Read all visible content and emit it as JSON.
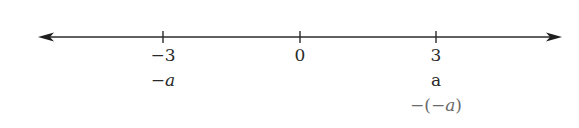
{
  "diagram": {
    "type": "number-line",
    "line": {
      "y": 37,
      "x_start": 38,
      "x_end": 562,
      "color": "#2b2b2b"
    },
    "ticks": [
      {
        "value": -3,
        "x": 163,
        "label": "−3"
      },
      {
        "value": 0,
        "x": 300,
        "label": "0"
      },
      {
        "value": 3,
        "x": 436,
        "label": "3"
      }
    ],
    "annotations": [
      {
        "x": 163,
        "row": 2,
        "prefix": "−",
        "var": "a",
        "suffix": "",
        "italic": true,
        "gray": false
      },
      {
        "x": 436,
        "row": 2,
        "prefix": "",
        "var": "a",
        "suffix": "",
        "italic": false,
        "gray": false
      },
      {
        "x": 436,
        "row": 3,
        "prefix": "−(−",
        "var": "a",
        "suffix": ")",
        "italic": true,
        "gray": true
      }
    ]
  }
}
